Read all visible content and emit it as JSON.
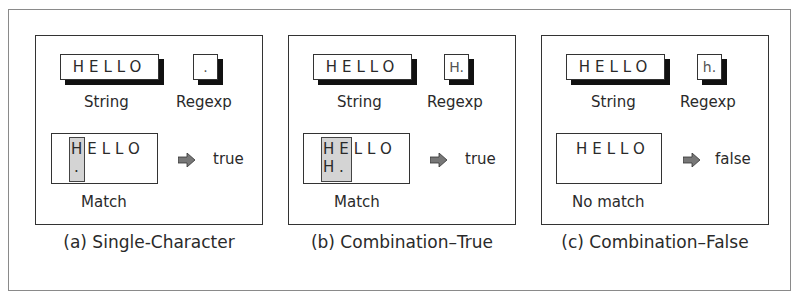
{
  "panels": [
    {
      "string": "HELLO",
      "regexp": ".",
      "string_label": "String",
      "regexp_label": "Regexp",
      "match_line1_hl": "H",
      "match_line1_rest": "ELLO",
      "match_line2": ".",
      "match_label": "Match",
      "result": "true",
      "caption": "(a) Single-Character"
    },
    {
      "string": "HELLO",
      "regexp": "H.",
      "string_label": "String",
      "regexp_label": "Regexp",
      "match_line1_hl": "HE",
      "match_line1_rest": "LLO",
      "match_line2": "H.",
      "match_label": "Match",
      "result": "true",
      "caption": "(b) Combination–True"
    },
    {
      "string": "HELLO",
      "regexp": "h.",
      "string_label": "String",
      "regexp_label": "Regexp",
      "match_text": "HELLO",
      "match_label": "No match",
      "result": "false",
      "caption": "(c) Combination–False"
    }
  ],
  "colors": {
    "highlight": "#d4d4d4",
    "arrow": "#777777",
    "shadow": "#111111"
  }
}
